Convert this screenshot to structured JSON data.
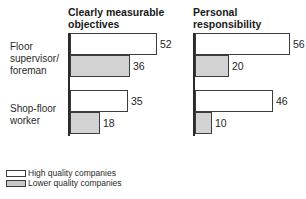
{
  "figure": {
    "background": "#ffffff",
    "bar_border_color": "#3c3c3c",
    "axis_color": "#2a2a2a",
    "high_quality_fill": "#ffffff",
    "lower_quality_fill": "#d2d2d2"
  },
  "chart_data": [
    {
      "type": "bar",
      "orientation": "horizontal",
      "title": "Clearly measurable objectives",
      "title_lines": [
        "Clearly measurable",
        "objectives"
      ],
      "categories": [
        "Floor supervisor/foreman",
        "Shop-floor worker"
      ],
      "series": [
        {
          "name": "High quality companies",
          "values": [
            52,
            35
          ]
        },
        {
          "name": "Lower quality companies",
          "values": [
            36,
            18
          ]
        }
      ],
      "xlim": [
        0,
        60
      ],
      "grid": false,
      "data_labels": true
    },
    {
      "type": "bar",
      "orientation": "horizontal",
      "title": "Personal responsibility",
      "title_lines": [
        "Personal",
        "responsibility"
      ],
      "categories": [
        "Floor supervisor/foreman",
        "Shop-floor worker"
      ],
      "series": [
        {
          "name": "High quality companies",
          "values": [
            56,
            46
          ]
        },
        {
          "name": "Lower quality companies",
          "values": [
            20,
            10
          ]
        }
      ],
      "xlim": [
        0,
        60
      ],
      "grid": false,
      "data_labels": true
    }
  ],
  "category_labels": [
    {
      "lines": [
        "Floor",
        "supervisor/",
        "foreman"
      ]
    },
    {
      "lines": [
        "Shop-floor",
        "worker"
      ]
    }
  ],
  "legend": {
    "position": "bottom-left",
    "items": [
      {
        "label": "High quality companies",
        "fill": "#ffffff"
      },
      {
        "label": "Lower quality companies",
        "fill": "#c9c9c9"
      }
    ]
  }
}
